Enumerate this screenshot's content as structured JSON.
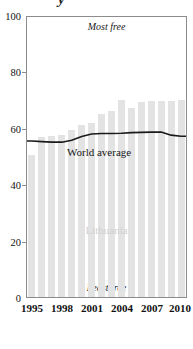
{
  "chart_data": {
    "type": "bar",
    "title": "",
    "xlabel": "",
    "ylabel": "",
    "ylim": [
      0,
      100
    ],
    "xlim": [
      1995,
      2010
    ],
    "grid": false,
    "legend": "none",
    "categories": [
      "1995",
      "1996",
      "1997",
      "1998",
      "1999",
      "2000",
      "2001",
      "2002",
      "2003",
      "2004",
      "2005",
      "2006",
      "2007",
      "2008",
      "2009",
      "2010"
    ],
    "series": [
      {
        "name": "Lithuania",
        "type": "bar",
        "color": "#e3e3e3",
        "values": [
          50.7,
          57.3,
          57.5,
          58.0,
          59.5,
          61.5,
          62.0,
          65.5,
          66.5,
          70.5,
          67.5,
          69.5,
          70.0,
          70.0,
          70.0,
          70.5
        ]
      },
      {
        "name": "World average",
        "type": "line",
        "color": "#1a1a1a",
        "values": [
          55.7,
          55.5,
          55.3,
          55.3,
          56.0,
          57.3,
          58.2,
          58.4,
          58.4,
          58.5,
          58.7,
          58.8,
          58.9,
          58.9,
          57.8,
          57.4
        ]
      }
    ],
    "yticks": [
      0,
      20,
      40,
      60,
      80,
      100
    ],
    "xticks": [
      "1995",
      "1998",
      "2001",
      "2004",
      "2007",
      "2010"
    ],
    "annotations": {
      "top_label": "Most free",
      "bottom_label": "Least free",
      "line_label": "World average",
      "bar_label": "Lithuania"
    },
    "title_fragment": "y"
  }
}
